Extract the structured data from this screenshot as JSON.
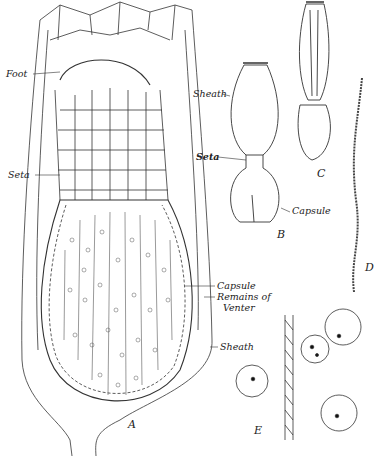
{
  "figure": {
    "panels": [
      {
        "id": "A",
        "label": "A",
        "labels": [
          "Foot",
          "Seta",
          "Capsule",
          "Remains of",
          "Venter",
          "Sheath"
        ]
      },
      {
        "id": "B",
        "label": "B",
        "labels": [
          "Sheath",
          "Seta",
          "Capsule"
        ]
      },
      {
        "id": "C",
        "label": "C"
      },
      {
        "id": "D",
        "label": "D"
      },
      {
        "id": "E",
        "label": "E"
      }
    ]
  },
  "labels": {
    "a_foot": "Foot",
    "a_seta": "Seta",
    "a_capsule": "Capsule",
    "a_remains1": "Remains of",
    "a_remains2": "Venter",
    "a_sheath": "Sheath",
    "b_sheath": "Sheath",
    "b_seta": "Seta",
    "b_capsule": "Capsule",
    "fig_a": "A",
    "fig_b": "B",
    "fig_c": "C",
    "fig_d": "D",
    "fig_e": "E"
  },
  "colors": {
    "ink": "#222222",
    "background": "#ffffff"
  }
}
